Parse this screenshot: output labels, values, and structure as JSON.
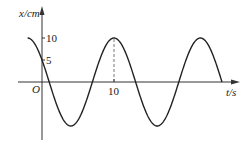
{
  "chart_data": {
    "type": "line",
    "title": "",
    "xlabel": "t/s",
    "ylabel": "x/cm",
    "origin_label": "O",
    "x_ticks": [
      {
        "value": 10,
        "label": "10"
      }
    ],
    "y_ticks": [
      {
        "value": 10,
        "label": "10"
      },
      {
        "value": 5,
        "label": "5"
      }
    ],
    "xlim": [
      -2,
      25
    ],
    "ylim": [
      -10,
      10
    ],
    "grid": false,
    "annotations": [
      {
        "type": "dashed-vertical",
        "x": 10,
        "from_y": 0,
        "to_y": 10
      }
    ],
    "series": [
      {
        "name": "x(t) = 10 cos(πt/6 + π/3)",
        "amplitude": 10,
        "period": 12,
        "x": [
          -2,
          0,
          1,
          4,
          7,
          10,
          13,
          16,
          19,
          22,
          25
        ],
        "values": [
          10,
          5,
          0,
          -10,
          0,
          10,
          0,
          -10,
          0,
          10,
          0
        ]
      }
    ]
  },
  "labels": {
    "y_axis": "x/cm",
    "x_axis": "t/s",
    "origin": "O",
    "y_tick_10": "10",
    "y_tick_5": "5",
    "x_tick_10": "10"
  }
}
